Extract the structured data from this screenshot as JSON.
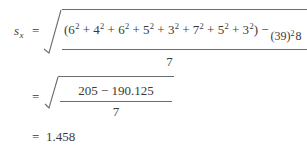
{
  "figure": {
    "kind": "math-formula",
    "background_color": "#ffffff",
    "text_color": "#3a3a3a",
    "rule_color": "#6d6d6d"
  },
  "line1": {
    "symbol": "s",
    "subscript": "x",
    "equals": "=",
    "numerator": {
      "sum_open": "(6",
      "terms": [
        {
          "base": "6",
          "exponent": "2"
        },
        {
          "base": "4",
          "exponent": "2"
        },
        {
          "base": "6",
          "exponent": "2"
        },
        {
          "base": "5",
          "exponent": "2"
        },
        {
          "base": "3",
          "exponent": "2"
        },
        {
          "base": "7",
          "exponent": "2"
        },
        {
          "base": "5",
          "exponent": "2"
        },
        {
          "base": "3",
          "exponent": "2"
        }
      ],
      "plus": "+",
      "open_paren": "(",
      "close_paren": ")",
      "minus": "−",
      "correction": {
        "numerator_text": "(39)",
        "numerator_exponent": "2",
        "denominator": "8"
      }
    },
    "denominator": "7"
  },
  "line2": {
    "equals": "=",
    "numerator": "205 − 190.125",
    "denominator": "7"
  },
  "line3": {
    "equals": "=",
    "value": "1.458"
  }
}
